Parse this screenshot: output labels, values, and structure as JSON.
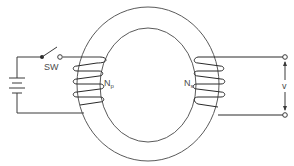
{
  "diagram": {
    "type": "toroidal transformer circuit",
    "labels": {
      "switch": "SW",
      "primary": "N",
      "primary_sub": "p",
      "secondary": "N",
      "secondary_sub": "s",
      "output_voltage": "v"
    },
    "components": [
      {
        "id": "battery",
        "kind": "DC source"
      },
      {
        "id": "switch",
        "kind": "open switch",
        "label": "SW"
      },
      {
        "id": "core",
        "kind": "toroidal iron core"
      },
      {
        "id": "primary_coil",
        "kind": "winding",
        "label": "Np",
        "turns_drawn": 4
      },
      {
        "id": "secondary_coil",
        "kind": "winding",
        "label": "Ns",
        "turns_drawn": 4
      },
      {
        "id": "output_terminals",
        "kind": "terminal pair",
        "label": "v"
      }
    ],
    "colors": {
      "line": "#3a3a3a",
      "background": "#ffffff"
    }
  }
}
